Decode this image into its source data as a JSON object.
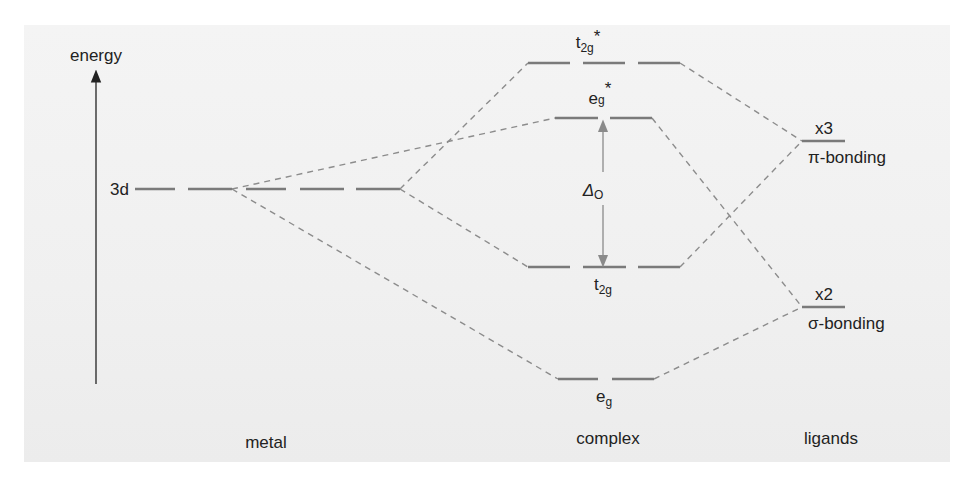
{
  "diagram": {
    "colors": {
      "background": "#f1f1f1",
      "level": "#7a7a7a",
      "dash": "#8c8c8c",
      "text": "#222222",
      "axis": "#222222"
    },
    "axis": {
      "label": "energy"
    },
    "columns": {
      "metal": "metal",
      "complex": "complex",
      "ligands": "ligands"
    },
    "metal_level": {
      "label": "3d"
    },
    "complex_levels": {
      "t2g_star": {
        "base": "t",
        "sub": "2g",
        "sup": "*"
      },
      "eg_star": {
        "base": "e",
        "sub": "g",
        "sup": "*"
      },
      "t2g": {
        "base": "t",
        "sub": "2g"
      },
      "eg": {
        "base": "e",
        "sub": "g"
      }
    },
    "splitting": {
      "symbol": "Δ",
      "sub": "O"
    },
    "ligand_levels": {
      "pi": {
        "multiplicity": "x3",
        "label": "π-bonding"
      },
      "sigma": {
        "multiplicity": "x2",
        "label": "σ-bonding"
      }
    }
  }
}
